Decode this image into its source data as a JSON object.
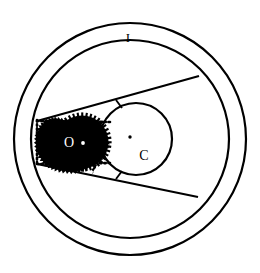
{
  "figure": {
    "title": "",
    "background_color": "#ffffff",
    "stroke_color": "#000000",
    "fill_color": "#000000"
  },
  "labels": {
    "outer_annulus": "I",
    "occluder_region": "O",
    "inner_circle": "C"
  },
  "geometry": {
    "outer_circle": {
      "cx": 130,
      "cy": 139,
      "r": 116,
      "stroke_width": 2.2
    },
    "inner_circle": {
      "cx": 130,
      "cy": 139,
      "r": 99,
      "stroke_width": 2.2
    },
    "circle_c": {
      "cx": 136,
      "cy": 139,
      "r": 36,
      "stroke_width": 2.2
    },
    "black_disk": {
      "cx": 82,
      "cy": 142,
      "r": 25,
      "teeth": 40,
      "tooth_depth": 3.2
    },
    "apex": {
      "x": 37,
      "y": 142
    },
    "dotted_left_edge": {
      "x": 37,
      "y_top": 120,
      "y_bottom": 165
    },
    "tangent_upper_end": {
      "x": 199,
      "y": 76
    },
    "tangent_lower_end": {
      "x": 198,
      "y": 197
    },
    "tick_upper": {
      "x": 119,
      "y": 104
    },
    "tick_lower": {
      "x": 119,
      "y": 175
    },
    "center_dot_c": {
      "x": 130,
      "y": 137,
      "r": 1.8
    },
    "center_dot_o": {
      "x": 83,
      "y": 143,
      "r": 1.8
    }
  },
  "label_positions": {
    "I": {
      "x": 128,
      "y": 42,
      "size": 13
    },
    "O": {
      "x": 69,
      "y": 147,
      "size": 14,
      "color": "#ffffff"
    },
    "C": {
      "x": 144,
      "y": 160,
      "size": 14,
      "color": "#000000"
    }
  }
}
